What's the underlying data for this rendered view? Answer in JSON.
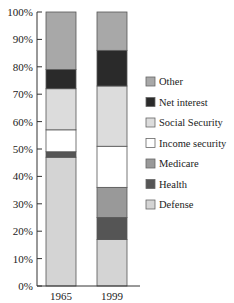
{
  "chart_data": {
    "type": "bar",
    "stacked": true,
    "title": "",
    "xlabel": "",
    "ylabel": "",
    "ylim": [
      0,
      100
    ],
    "yticks": [
      "0%",
      "10%",
      "20%",
      "30%",
      "40%",
      "50%",
      "60%",
      "70%",
      "80%",
      "90%",
      "100%"
    ],
    "categories": [
      "1965",
      "1999"
    ],
    "grid": false,
    "legend_position": "right",
    "series": [
      {
        "name": "Defense",
        "color": "#d4d4d4",
        "values": [
          47,
          17
        ]
      },
      {
        "name": "Health",
        "color": "#555555",
        "values": [
          2,
          8
        ]
      },
      {
        "name": "Medicare",
        "color": "#999999",
        "values": [
          0,
          11
        ]
      },
      {
        "name": "Income security",
        "color": "#ffffff",
        "values": [
          8,
          15
        ]
      },
      {
        "name": "Social Security",
        "color": "#dcdcdc",
        "values": [
          15,
          22
        ]
      },
      {
        "name": "Net interest",
        "color": "#2a2a2a",
        "values": [
          7,
          13
        ]
      },
      {
        "name": "Other",
        "color": "#a8a8a8",
        "values": [
          21,
          14
        ]
      }
    ],
    "legend_order": [
      "Other",
      "Net interest",
      "Social Security",
      "Income security",
      "Medicare",
      "Health",
      "Defense"
    ]
  }
}
